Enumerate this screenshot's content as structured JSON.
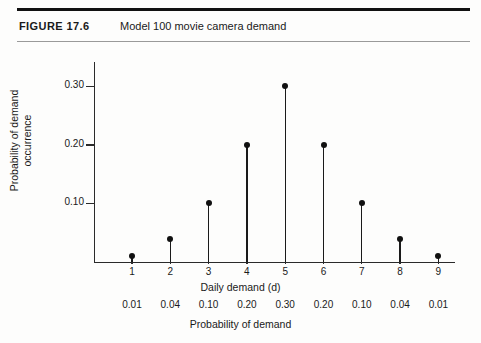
{
  "figure": {
    "label": "FIGURE 17.6",
    "title": "Model 100 movie camera demand"
  },
  "chart_data": {
    "type": "scatter",
    "title": "Model 100 movie camera demand",
    "xlabel": "Daily demand (d)",
    "ylabel": "Probability of demand occurrence",
    "secondary_xlabel": "Probability of demand",
    "categories": [
      1,
      2,
      3,
      4,
      5,
      6,
      7,
      8,
      9
    ],
    "x_tick_labels": [
      "1",
      "2",
      "3",
      "4",
      "5",
      "6",
      "7",
      "8",
      "9"
    ],
    "values": [
      0.01,
      0.04,
      0.1,
      0.2,
      0.3,
      0.2,
      0.1,
      0.04,
      0.01
    ],
    "value_labels": [
      "0.01",
      "0.04",
      "0.10",
      "0.20",
      "0.30",
      "0.20",
      "0.10",
      "0.04",
      "0.01"
    ],
    "y_tick_values": [
      0.1,
      0.2,
      0.3
    ],
    "y_tick_labels": [
      "0.10",
      "0.20",
      "0.30"
    ],
    "ylim": [
      0,
      0.345
    ],
    "xlim": [
      0.4,
      9.5
    ],
    "grid": false,
    "legend": false,
    "marker": "filled-circle",
    "style": "stem"
  },
  "colors": {
    "ink": "#111111",
    "axis": "#2a2a2a",
    "rule_thin": "#9a9a9a",
    "background": "#fdfdfc"
  }
}
